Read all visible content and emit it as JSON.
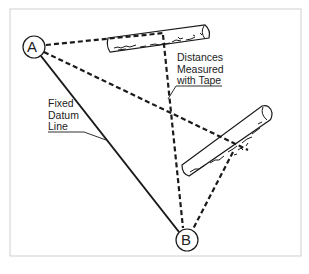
{
  "diagram": {
    "type": "surveying / datum-line measurement diagram",
    "points": [
      {
        "id": "A",
        "label": "A"
      },
      {
        "id": "B",
        "label": "B"
      }
    ],
    "labels": {
      "datum": {
        "line1": "Fixed",
        "line2": "Datum",
        "line3": "Line"
      },
      "tape": {
        "line1": "Distances",
        "line2": "Measured",
        "line3": "with Tape"
      }
    },
    "objects": [
      "log-upper",
      "log-lower"
    ],
    "colors": {
      "line": "#1a1a1a",
      "frame": "#cfcfcf",
      "background": "#ffffff"
    }
  }
}
